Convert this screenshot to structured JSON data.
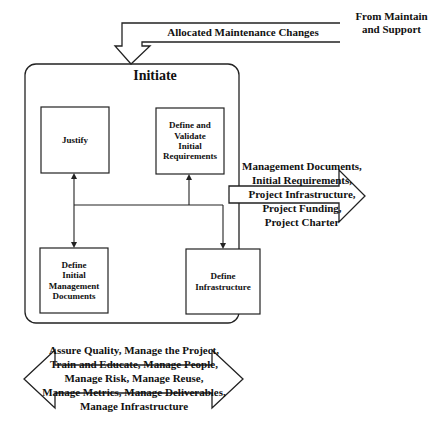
{
  "diagram": {
    "container": {
      "title": "Initiate"
    },
    "input_arrow": {
      "label": "Allocated Maintenance Changes",
      "source_line1": "From Maintain",
      "source_line2": "and Support"
    },
    "boxes": [
      {
        "id": "justify",
        "label": "Justify"
      },
      {
        "id": "define-validate",
        "lines": [
          "Define and",
          "Validate",
          "Initial",
          "Requirements"
        ]
      },
      {
        "id": "define-mgmt-docs",
        "lines": [
          "Define",
          "Initial",
          "Management",
          "Documents"
        ]
      },
      {
        "id": "define-infra",
        "lines": [
          "Define",
          "Infrastructure"
        ]
      }
    ],
    "output_arrow": {
      "lines": [
        "Management Documents,",
        "Initial Requirements,",
        "Project Infrastructure,",
        "Project Funding,",
        "Project Charter"
      ]
    },
    "support_arrow": {
      "lines": [
        "Assure Quality,  Manage the Project,",
        "Train and Educate, Manage People,",
        "Manage Risk, Manage Reuse,",
        "Manage Metrics, Manage Deliverables,",
        "Manage Infrastructure"
      ]
    },
    "colors": {
      "stroke": "#222222",
      "text": "#111111",
      "background": "#ffffff"
    }
  }
}
